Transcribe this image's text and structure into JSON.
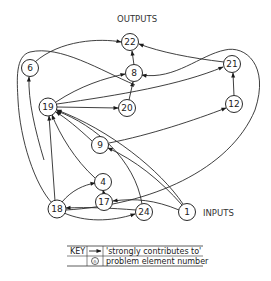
{
  "diagram": {
    "labels": {
      "outputs": "OUTPUTS",
      "inputs": "INPUTS"
    },
    "nodes": [
      {
        "id": "22",
        "x": 130,
        "y": 42
      },
      {
        "id": "8",
        "x": 134,
        "y": 73
      },
      {
        "id": "6",
        "x": 30,
        "y": 68
      },
      {
        "id": "21",
        "x": 232,
        "y": 64
      },
      {
        "id": "20",
        "x": 127,
        "y": 108
      },
      {
        "id": "19",
        "x": 48,
        "y": 107
      },
      {
        "id": "12",
        "x": 234,
        "y": 104
      },
      {
        "id": "9",
        "x": 100,
        "y": 145
      },
      {
        "id": "4",
        "x": 103,
        "y": 182
      },
      {
        "id": "17",
        "x": 104,
        "y": 202
      },
      {
        "id": "18",
        "x": 57,
        "y": 209
      },
      {
        "id": "24",
        "x": 144,
        "y": 212
      },
      {
        "id": "1",
        "x": 187,
        "y": 212
      }
    ],
    "edges": [
      {
        "from": "6",
        "to": "22"
      },
      {
        "from": "8",
        "to": "22"
      },
      {
        "from": "21",
        "to": "22"
      },
      {
        "from": "19",
        "to": "8"
      },
      {
        "from": "20",
        "to": "8"
      },
      {
        "from": "19",
        "to": "20"
      },
      {
        "from": "19",
        "to": "21"
      },
      {
        "from": "12",
        "to": "21"
      },
      {
        "from": "9",
        "to": "12"
      },
      {
        "from": "19",
        "to": "6"
      },
      {
        "from": "9",
        "to": "19"
      },
      {
        "from": "4",
        "to": "19"
      },
      {
        "from": "1",
        "to": "19"
      },
      {
        "from": "24",
        "to": "19"
      },
      {
        "from": "18",
        "to": "19"
      },
      {
        "from": "1",
        "to": "9"
      },
      {
        "from": "17",
        "to": "4"
      },
      {
        "from": "18",
        "to": "4"
      },
      {
        "from": "1",
        "to": "17"
      },
      {
        "from": "24",
        "to": "18"
      },
      {
        "from": "18",
        "to": "24"
      },
      {
        "from": "1",
        "to": "8"
      },
      {
        "from": "6",
        "to": "1"
      }
    ]
  },
  "key": {
    "title": "KEY",
    "rows": [
      {
        "symbol": "arrow",
        "text": "'strongly contributes to'"
      },
      {
        "symbol": "circle-n",
        "glyph": "n",
        "text": "problem element number"
      }
    ]
  }
}
